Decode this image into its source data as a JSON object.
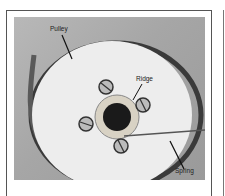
{
  "figure": {
    "callouts": [
      {
        "id": "pulley",
        "text": "Pulley"
      },
      {
        "id": "ridge",
        "text": "Ridge"
      },
      {
        "id": "spring",
        "text": "Spring"
      }
    ]
  }
}
